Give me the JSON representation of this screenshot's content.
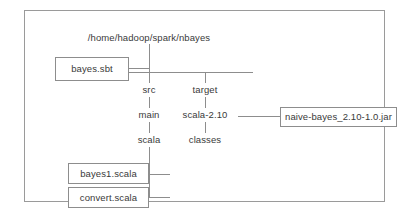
{
  "diagram": {
    "root_path": "/home/hadoop/spark/nbayes",
    "nodes": {
      "bayes_sbt": "bayes.sbt",
      "src": "src",
      "main": "main",
      "scala": "scala",
      "target": "target",
      "scala_2_10": "scala-2.10",
      "classes": "classes",
      "jar": "naive-bayes_2.10-1.0.jar",
      "bayes1_scala": "bayes1.scala",
      "convert_scala": "convert.scala"
    },
    "colors": {
      "frame_border": "#9a9a9a",
      "box_border": "#8d8d8d",
      "connector": "#8d8d8d",
      "text": "#3a3a3a",
      "background": "#ffffff"
    }
  }
}
